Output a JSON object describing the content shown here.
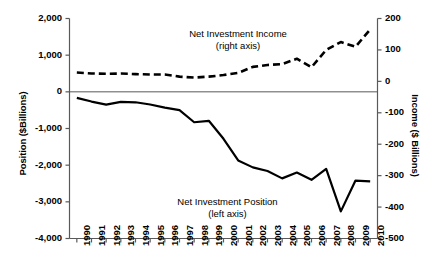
{
  "chart_data": {
    "type": "line",
    "title": "",
    "xlabel": "",
    "ylabel": "Position ($Billions)",
    "y2label": "Income ($ Billions)",
    "categories": [
      "1990",
      "1991",
      "1992",
      "1993",
      "1994",
      "1995",
      "1996",
      "1997",
      "1998",
      "1999",
      "2000",
      "2001",
      "2002",
      "2003",
      "2004",
      "2005",
      "2006",
      "2007",
      "2008",
      "2009",
      "2010"
    ],
    "ylim": [
      -4000,
      2000
    ],
    "yticks": [
      "2,000",
      "1,000",
      "0",
      "-1,000",
      "-2,000",
      "-3,000",
      "-4,000"
    ],
    "ytick_values": [
      2000,
      1000,
      0,
      -1000,
      -2000,
      -3000,
      -4000
    ],
    "y2lim": [
      -500,
      200
    ],
    "y2ticks": [
      "200",
      "100",
      "0",
      "-100",
      "-200",
      "-300",
      "-400",
      "-500"
    ],
    "y2tick_values": [
      200,
      100,
      0,
      -100,
      -200,
      -300,
      -400,
      -500
    ],
    "grid": false,
    "legend_position": "inline-annotation",
    "series": [
      {
        "name": "Net Investment Position",
        "axis": "left",
        "style": "solid",
        "annotation": "Net Investment Position",
        "annotation_sub": "(left axis)",
        "values": [
          -165,
          -265,
          -350,
          -275,
          -285,
          -345,
          -430,
          -500,
          -830,
          -790,
          -1280,
          -1870,
          -2060,
          -2160,
          -2360,
          -2200,
          -2400,
          -2100,
          -3260,
          -2420,
          -2440
        ]
      },
      {
        "name": "Net Investment Income",
        "axis": "right",
        "style": "dashed",
        "annotation": "Net Investment Income",
        "annotation_sub": "(right axis)",
        "values": [
          28,
          25,
          24,
          25,
          23,
          22,
          22,
          15,
          12,
          15,
          20,
          27,
          46,
          52,
          55,
          72,
          45,
          100,
          125,
          110,
          165
        ]
      }
    ]
  },
  "labels": {
    "y_axis_left": "Position ($Billions)",
    "y_axis_right": "Income ($ Billions)",
    "income_annotation_line1": "Net Investment Income",
    "income_annotation_line2": "(right axis)",
    "position_annotation_line1": "Net Investment Position",
    "position_annotation_line2": "(left axis)"
  },
  "colors": {
    "line": "#000000",
    "axis": "#595959",
    "background": "#ffffff"
  }
}
